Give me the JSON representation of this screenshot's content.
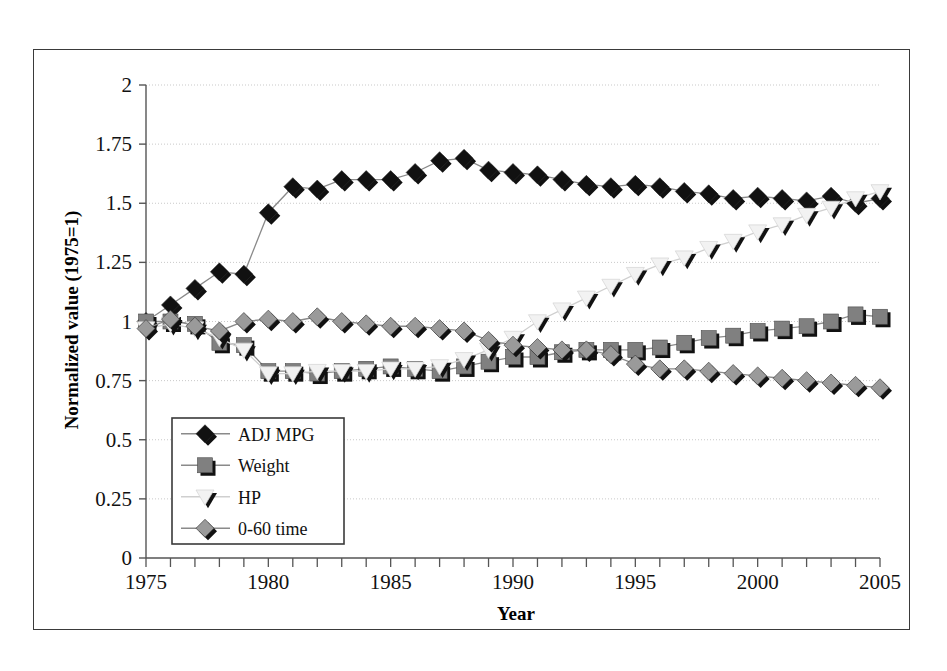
{
  "chart_data": {
    "type": "line",
    "title": "",
    "xlabel": "Year",
    "ylabel": "Normalized value (1975=1)",
    "xlim": [
      1975,
      2005
    ],
    "ylim": [
      0,
      2
    ],
    "ytick_labels": [
      "0",
      "0.25",
      "0.5",
      "0.75",
      "1",
      "1.25",
      "1.5",
      "1.75",
      "2"
    ],
    "ytick_values": [
      0,
      0.25,
      0.5,
      0.75,
      1,
      1.25,
      1.5,
      1.75,
      2
    ],
    "xtick_labels": [
      "1975",
      "1980",
      "1985",
      "1990",
      "1995",
      "2000",
      "2005"
    ],
    "xtick_values": [
      1975,
      1980,
      1985,
      1990,
      1995,
      2000,
      2005
    ],
    "minor_xticks_every": 1,
    "grid": "horizontal-dotted",
    "legend_position": "inner-lower-left",
    "x": [
      1975,
      1976,
      1977,
      1978,
      1979,
      1980,
      1981,
      1982,
      1983,
      1984,
      1985,
      1986,
      1987,
      1988,
      1989,
      1990,
      1991,
      1992,
      1993,
      1994,
      1995,
      1996,
      1997,
      1998,
      1999,
      2000,
      2001,
      2002,
      2003,
      2004,
      2005
    ],
    "series": [
      {
        "name": "ADJ MPG",
        "marker": "diamond",
        "color": "#111111",
        "values": [
          1.0,
          1.07,
          1.14,
          1.21,
          1.2,
          1.46,
          1.57,
          1.56,
          1.6,
          1.6,
          1.6,
          1.63,
          1.68,
          1.69,
          1.64,
          1.63,
          1.62,
          1.6,
          1.58,
          1.57,
          1.58,
          1.57,
          1.55,
          1.54,
          1.52,
          1.53,
          1.52,
          1.51,
          1.53,
          1.5,
          1.52
        ]
      },
      {
        "name": "Weight",
        "marker": "square",
        "color": "#808080",
        "values": [
          1.0,
          1.0,
          0.99,
          0.91,
          0.9,
          0.79,
          0.79,
          0.78,
          0.79,
          0.8,
          0.81,
          0.8,
          0.79,
          0.81,
          0.83,
          0.85,
          0.85,
          0.87,
          0.88,
          0.88,
          0.88,
          0.89,
          0.91,
          0.93,
          0.94,
          0.96,
          0.97,
          0.98,
          1.0,
          1.03,
          1.02
        ]
      },
      {
        "name": "HP",
        "marker": "open-triangle",
        "color": "#f2f2f2",
        "values": [
          0.97,
          0.99,
          0.97,
          0.93,
          0.88,
          0.78,
          0.78,
          0.79,
          0.79,
          0.79,
          0.8,
          0.8,
          0.81,
          0.84,
          0.88,
          0.93,
          1.0,
          1.05,
          1.1,
          1.15,
          1.2,
          1.24,
          1.27,
          1.31,
          1.34,
          1.38,
          1.41,
          1.45,
          1.48,
          1.52,
          1.55
        ]
      },
      {
        "name": "0-60 time",
        "marker": "diamond",
        "color": "#9a9a9a",
        "values": [
          0.97,
          1.01,
          0.98,
          0.96,
          1.0,
          1.01,
          1.0,
          1.02,
          1.0,
          0.99,
          0.98,
          0.98,
          0.97,
          0.96,
          0.92,
          0.9,
          0.89,
          0.88,
          0.88,
          0.86,
          0.82,
          0.8,
          0.8,
          0.79,
          0.78,
          0.77,
          0.76,
          0.75,
          0.74,
          0.73,
          0.72
        ]
      }
    ]
  },
  "legend": {
    "items": [
      {
        "label": "ADJ MPG"
      },
      {
        "label": "Weight"
      },
      {
        "label": "HP"
      },
      {
        "label": "0-60 time"
      }
    ]
  }
}
